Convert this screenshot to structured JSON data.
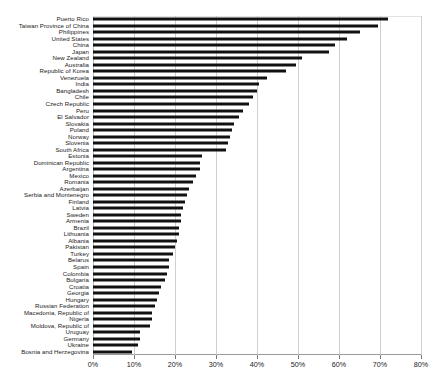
{
  "chart_data": {
    "type": "bar",
    "orientation": "horizontal",
    "title": "",
    "subtitle": "",
    "xlabel": "",
    "ylabel": "",
    "xlim": [
      0,
      80
    ],
    "xticks": [
      0,
      10,
      20,
      30,
      40,
      50,
      60,
      70,
      80
    ],
    "xtick_labels": [
      "0%",
      "10%",
      "20%",
      "30%",
      "40%",
      "50%",
      "60%",
      "70%",
      "80%"
    ],
    "grid": true,
    "legend": false,
    "bar_color": "#111111",
    "grid_color": "#cfcfcf",
    "categories": [
      "Puerto Rico",
      "Taiwan Province of China",
      "Philippines",
      "United States",
      "China",
      "Japan",
      "New Zealand",
      "Australia",
      "Republic of Korea",
      "Venezuela",
      "India",
      "Bangladesh",
      "Chile",
      "Czech Republic",
      "Peru",
      "El Salvador",
      "Slovakia",
      "Poland",
      "Norway",
      "Slovenia",
      "South Africa",
      "Estonia",
      "Dominican Republic",
      "Argentina",
      "Mexico",
      "Romania",
      "Azerbaijan",
      "Serbia and Montenegro",
      "Finland",
      "Latvia",
      "Sweden",
      "Armenia",
      "Brazil",
      "Lithuania",
      "Albania",
      "Pakistan",
      "Turkey",
      "Belarus",
      "Spain",
      "Colombia",
      "Bulgaria",
      "Croatia",
      "Georgia",
      "Hungary",
      "Russian Federation",
      "Macedonia, Republic of",
      "Nigeria",
      "Moldova, Republic of",
      "Uruguay",
      "Germany",
      "Ukraine",
      "Bosnia and Herzegovina"
    ],
    "values": [
      72.0,
      69.5,
      65.0,
      62.0,
      59.0,
      57.5,
      51.0,
      49.5,
      47.0,
      42.5,
      40.5,
      40.0,
      39.0,
      38.0,
      36.5,
      35.5,
      34.5,
      34.0,
      33.5,
      33.0,
      32.5,
      26.5,
      26.0,
      26.0,
      25.0,
      24.5,
      23.5,
      23.0,
      22.5,
      22.0,
      21.5,
      21.5,
      21.0,
      21.0,
      20.5,
      20.0,
      19.5,
      18.5,
      18.5,
      18.0,
      17.5,
      16.5,
      16.0,
      15.5,
      15.0,
      14.5,
      14.5,
      14.0,
      11.5,
      11.5,
      11.0,
      9.5
    ]
  }
}
